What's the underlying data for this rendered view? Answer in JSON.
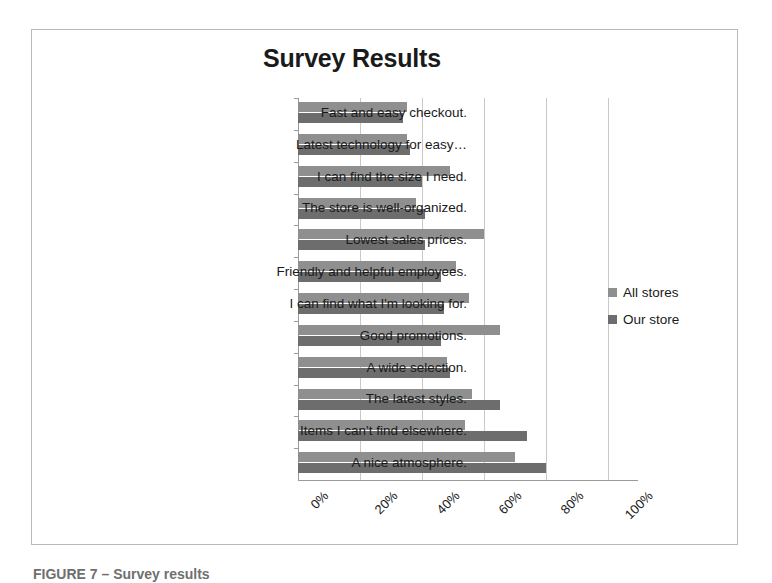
{
  "chart_data": {
    "type": "bar",
    "orientation": "horizontal",
    "title": "Survey Results",
    "xlabel": "",
    "ylabel": "",
    "xlim": [
      0,
      100
    ],
    "xticks": [
      "0%",
      "20%",
      "40%",
      "60%",
      "80%",
      "100%"
    ],
    "xtick_values": [
      0,
      20,
      40,
      60,
      80,
      100
    ],
    "grid": true,
    "legend_position": "right",
    "categories": [
      "Fast and easy checkout.",
      "Latest technology for easy…",
      "I can find the size I need.",
      "The store is well-organized.",
      "Lowest sales prices.",
      "Friendly and helpful employees.",
      "I can find what I'm looking for.",
      "Good promotions.",
      "A wide selection.",
      "The latest styles.",
      "Items I can't find elsewhere.",
      "A nice atmosphere."
    ],
    "series": [
      {
        "name": "All stores",
        "color": "#8f8f8f",
        "values": [
          35,
          35,
          49,
          38,
          60,
          51,
          55,
          65,
          48,
          56,
          54,
          70
        ]
      },
      {
        "name": "Our store",
        "color": "#6d6d6d",
        "values": [
          34,
          36,
          40,
          41,
          41,
          46,
          47,
          46,
          49,
          65,
          74,
          80
        ]
      }
    ]
  },
  "caption": "FIGURE 7 – Survey results",
  "colors": {
    "frame": "#b9b9b9",
    "gridline": "#c9c9c9",
    "axis": "#9a9a9a",
    "all_stores": "#8f8f8f",
    "our_store": "#6d6d6d"
  }
}
